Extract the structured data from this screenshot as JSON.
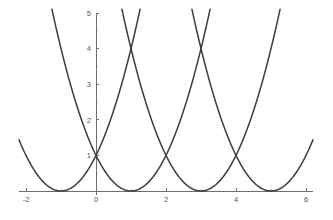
{
  "chart_data": {
    "type": "line",
    "title": "",
    "subtitle": "",
    "xlabel": "",
    "ylabel": "",
    "xlim": [
      -2.2,
      6.2
    ],
    "ylim": [
      -0.35,
      5.15
    ],
    "grid": false,
    "legend_position": "none",
    "x_ticks": [
      -2,
      0,
      2,
      4,
      6
    ],
    "x_tick_labels": [
      "-2",
      "0",
      "2",
      "4",
      "6"
    ],
    "x_minor_ticks": [
      -1,
      1,
      3,
      5
    ],
    "y_ticks": [
      1,
      2,
      3,
      4,
      5
    ],
    "y_tick_labels": [
      "1",
      "2",
      "3",
      "4",
      "5"
    ],
    "y_minor_ticks": [
      0.5,
      1.5,
      2.5,
      3.5,
      4.5
    ],
    "curve_color": "#3c3c3c",
    "axis_color": "#6e6e6e",
    "background_color": "#ffffff",
    "annotations": [
      {
        "label": "crossing",
        "x": 1,
        "y": 4
      },
      {
        "label": "crossing",
        "x": 3,
        "y": 4
      },
      {
        "label": "crossing",
        "x": 0,
        "y": 1
      },
      {
        "label": "crossing",
        "x": 2,
        "y": 1
      },
      {
        "label": "crossing",
        "x": 4,
        "y": 1
      }
    ],
    "series": [
      {
        "name": "y = (x + 1)^2",
        "vertex": [
          -1,
          0
        ],
        "coefficient": 1,
        "x": [
          -2.25,
          -2,
          -1.75,
          -1.5,
          -1.25,
          -1,
          -0.75,
          -0.5,
          -0.25,
          0,
          0.25,
          0.5,
          0.75,
          1,
          1.25
        ],
        "values": [
          1.5625,
          1,
          0.5625,
          0.25,
          0.0625,
          0,
          0.0625,
          0.25,
          0.5625,
          1,
          1.5625,
          2.25,
          3.0625,
          4,
          5.0625
        ]
      },
      {
        "name": "y = (x - 1)^2",
        "vertex": [
          1,
          0
        ],
        "coefficient": 1,
        "x": [
          -1.25,
          -1,
          -0.75,
          -0.5,
          -0.25,
          0,
          0.25,
          0.5,
          0.75,
          1,
          1.25,
          1.5,
          1.75,
          2,
          2.25,
          2.5,
          2.75,
          3,
          3.25
        ],
        "values": [
          5.0625,
          4,
          3.0625,
          2.25,
          1.5625,
          1,
          0.5625,
          0.25,
          0.0625,
          0,
          0.0625,
          0.25,
          0.5625,
          1,
          1.5625,
          2.25,
          3.0625,
          4,
          5.0625
        ]
      },
      {
        "name": "y = (x - 3)^2",
        "vertex": [
          3,
          0
        ],
        "coefficient": 1,
        "x": [
          0.75,
          1,
          1.25,
          1.5,
          1.75,
          2,
          2.25,
          2.5,
          2.75,
          3,
          3.25,
          3.5,
          3.75,
          4,
          4.25,
          4.5,
          4.75,
          5,
          5.25
        ],
        "values": [
          5.0625,
          4,
          3.0625,
          2.25,
          1.5625,
          1,
          0.5625,
          0.25,
          0.0625,
          0,
          0.0625,
          0.25,
          0.5625,
          1,
          1.5625,
          2.25,
          3.0625,
          4,
          5.0625
        ]
      },
      {
        "name": "y = (x - 5)^2",
        "vertex": [
          5,
          0
        ],
        "coefficient": 1,
        "x": [
          2.75,
          3,
          3.25,
          3.5,
          3.75,
          4,
          4.25,
          4.5,
          4.75,
          5,
          5.25,
          5.5,
          5.75,
          6,
          6.2
        ],
        "values": [
          5.0625,
          4,
          3.0625,
          2.25,
          1.5625,
          1,
          0.5625,
          0.25,
          0.0625,
          0,
          0.0625,
          0.25,
          0.5625,
          1,
          1.44
        ]
      }
    ]
  }
}
